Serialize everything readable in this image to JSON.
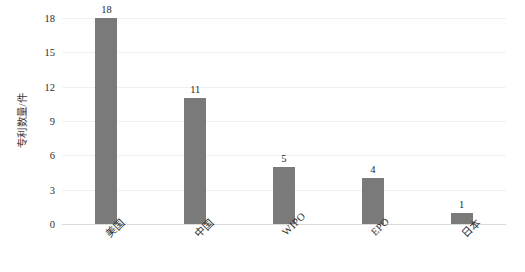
{
  "chart_data": {
    "type": "bar",
    "title": "",
    "subtitle": "",
    "xlabel": "",
    "ylabel": "专利数量/件",
    "categories": [
      "美国",
      "中国",
      "WIPO",
      "EPO",
      "日本"
    ],
    "values": [
      18,
      11,
      5,
      4,
      1
    ],
    "value_labels": [
      "18",
      "11",
      "5",
      "4",
      "1"
    ],
    "ylim": [
      0,
      18
    ],
    "yticks": [
      0,
      3,
      6,
      9,
      12,
      15,
      18
    ],
    "ytick_labels": [
      "0",
      "3",
      "6",
      "9",
      "12",
      "15",
      "18"
    ],
    "grid": "horizontal",
    "legend": "none",
    "bar_color": "#7a7a7a",
    "grid_color": "#f0f0f0",
    "axis_color": "#dcdcdc",
    "background_color": "#ffffff",
    "text_color": "#2e2e2e",
    "series": [
      {
        "name": "专利数量",
        "values": [
          18,
          11,
          5,
          4,
          1
        ]
      }
    ]
  }
}
